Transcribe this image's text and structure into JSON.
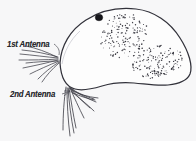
{
  "figure": {
    "kind": "biological-line-drawing",
    "background_color": "#f7f7f8",
    "ink_color": "#2f2f36",
    "eye_color": "#1a1a1f",
    "stipple_color": "#3a3a42"
  },
  "labels": [
    {
      "id": "first-antenna",
      "text": "1st Antenna",
      "x": 7,
      "y": 40
    },
    {
      "id": "second-antenna",
      "text": "2nd Antenna",
      "x": 10,
      "y": 90
    }
  ],
  "parts": {
    "body_outline": {
      "name": "carapace outline",
      "path": "M 60 63 C 62 44 74 27 92 17 C 108 8 128 7 146 13 C 166 20 182 36 189 55 C 193 66 192 76 185 82 C 176 89 162 88 150 86 C 136 84 122 82 110 84 C 96 86 84 90 74 88 C 66 86 60 78 60 63 Z"
    },
    "eye": {
      "name": "compound eye spot",
      "cx": 99,
      "cy": 17.5,
      "rx": 3.6,
      "ry": 3.2
    },
    "brood_pouch": {
      "name": "stippled brood pouch region",
      "dot_count": 330,
      "dot_radius": 0.55
    },
    "first_antenna": {
      "name": "first antenna setae bundle",
      "seta_count": 9,
      "origin_x": 58,
      "origin_y": 58
    },
    "second_antenna": {
      "name": "second antenna branched setae",
      "seta_count": 11,
      "origin_x": 70,
      "origin_y": 88
    },
    "leader_lines": {
      "name": "label leader lines",
      "count": 2
    }
  }
}
